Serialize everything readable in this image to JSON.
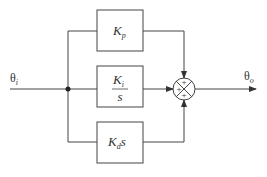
{
  "diagram": {
    "type": "block-diagram",
    "input_label": "θ",
    "input_sub": "i",
    "output_label": "θ",
    "output_sub": "o",
    "blocks": [
      {
        "id": "proportional",
        "main": "K",
        "sub": "p",
        "suffix": ""
      },
      {
        "id": "integral",
        "numerator_main": "K",
        "numerator_sub": "i",
        "denominator": "s"
      },
      {
        "id": "derivative",
        "main": "K",
        "sub": "d",
        "suffix": "s"
      }
    ],
    "summer": {
      "signs": [
        "+",
        "+",
        "+"
      ]
    },
    "colors": {
      "line": "#333333",
      "background": "#ffffff"
    }
  }
}
